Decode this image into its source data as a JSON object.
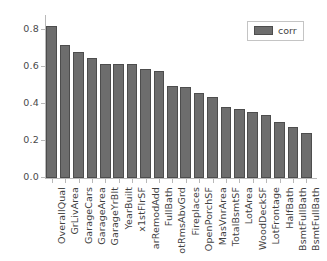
{
  "chart_data": {
    "type": "bar",
    "title": "",
    "xlabel": "",
    "ylabel": "",
    "ylim": [
      0.0,
      0.88
    ],
    "ytick_labels": [
      "0.0",
      "0.2",
      "0.4",
      "0.6",
      "0.8"
    ],
    "ytick_values": [
      0.0,
      0.2,
      0.4,
      0.6,
      0.8
    ],
    "grid": false,
    "legend_position": "upper right",
    "legend": [
      {
        "name": "corr",
        "color": "#6d6d6d"
      }
    ],
    "categories": [
      "OverallQual",
      "GrLivArea",
      "GarageCars",
      "GarageArea",
      "GarageYrBlt",
      "YearBuilt",
      "x1stFlrSF",
      "YearRemodAdd",
      "FullBath",
      "TotRmsAbvGrd",
      "Fireplaces",
      "OpenPorchSF",
      "MasVnrArea",
      "TotalBsmtSF",
      "LotArea",
      "WoodDeckSF",
      "LotFrontage",
      "HalfBath",
      "BsmtFullBath",
      "BsmtFullBath"
    ],
    "tick_labels_displayed": [
      "OverallQual",
      "GrLivArea",
      "GarageCars",
      "GarageArea",
      "GarageYrBlt",
      "YearBuilt",
      "x1stFlrSF",
      "arRemodAdd",
      "FullBath",
      "otRmsAbvGrd",
      "Fireplaces",
      "OpenPorchSF",
      "MasVnrArea",
      "TotalBsmtSF",
      "LotArea",
      "WoodDeckSF",
      "LotFrontage",
      "HalfBath",
      "BsmtFullBath",
      "BsmtFullBath"
    ],
    "values": [
      0.82,
      0.72,
      0.68,
      0.65,
      0.615,
      0.615,
      0.615,
      0.59,
      0.58,
      0.495,
      0.49,
      0.46,
      0.435,
      0.385,
      0.37,
      0.355,
      0.34,
      0.305,
      0.275,
      0.245
    ],
    "series": [
      {
        "name": "corr",
        "values": [
          0.82,
          0.72,
          0.68,
          0.65,
          0.615,
          0.615,
          0.615,
          0.59,
          0.58,
          0.495,
          0.49,
          0.46,
          0.435,
          0.385,
          0.37,
          0.355,
          0.34,
          0.305,
          0.275,
          0.245
        ]
      }
    ],
    "bar_color": "#6d6d6d",
    "bar_edge_color": "#4d4d4d"
  }
}
